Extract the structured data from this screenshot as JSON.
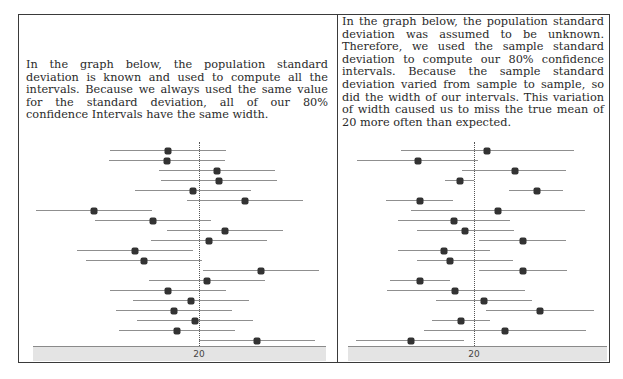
{
  "panels": [
    {
      "id": "left",
      "caption": "In the graph below, the population standard deviation is known and used to compute all the intervals.  Because we always used the same value for the standard deviation, all of our 80% confidence Intervals have the same width.",
      "axis_label": "20"
    },
    {
      "id": "right",
      "caption": "In the graph below, the population standard deviation was assumed to be unknown. Therefore, we used the sample standard deviation to compute our 80% confidence intervals.  Because the sample standard deviation varied from sample to sample, so did the width of our intervals.  This variation of width caused us to miss the true mean of 20 more often than expected.",
      "axis_label": "20"
    }
  ],
  "chart_data": [
    {
      "type": "scatter",
      "title": "80% confidence intervals, population standard deviation known",
      "xlabel": "",
      "ylabel": "",
      "reference_value": 20,
      "tick_labels": [
        "20"
      ],
      "grid": false,
      "legend": null,
      "interval_halfwidth": 5.8,
      "means": [
        16.9,
        16.8,
        21.8,
        22.0,
        19.4,
        24.6,
        9.5,
        15.4,
        22.6,
        21.0,
        13.6,
        14.5,
        26.2,
        20.8,
        16.9,
        19.2,
        17.5,
        19.6,
        17.8,
        25.8
      ],
      "lower": [
        11.1,
        11.0,
        16.0,
        16.2,
        13.6,
        18.8,
        3.7,
        9.6,
        16.8,
        15.2,
        7.8,
        8.7,
        20.4,
        15.0,
        11.1,
        13.4,
        11.7,
        13.8,
        12.0,
        20.0
      ],
      "upper": [
        22.7,
        22.6,
        27.6,
        27.8,
        25.2,
        30.4,
        15.3,
        21.2,
        28.4,
        26.8,
        19.4,
        20.3,
        32.0,
        26.6,
        22.7,
        25.0,
        23.3,
        25.4,
        23.6,
        31.6
      ]
    },
    {
      "type": "scatter",
      "title": "80% confidence intervals, sample standard deviation used",
      "xlabel": "",
      "ylabel": "",
      "reference_value": 20,
      "tick_labels": [
        "20"
      ],
      "grid": false,
      "legend": null,
      "means": [
        21.3,
        14.4,
        24.1,
        18.6,
        26.3,
        14.6,
        22.4,
        18.0,
        19.1,
        24.9,
        17.0,
        17.6,
        24.9,
        14.6,
        18.1,
        21.0,
        26.6,
        18.7,
        23.1,
        13.7
      ],
      "lower": [
        12.7,
        8.3,
        18.8,
        17.1,
        23.5,
        11.2,
        13.7,
        12.4,
        14.3,
        20.5,
        12.4,
        14.3,
        20.5,
        11.6,
        11.3,
        16.2,
        21.2,
        15.8,
        15.0,
        8.2
      ],
      "upper": [
        30.0,
        20.4,
        29.2,
        20.0,
        28.9,
        17.9,
        31.1,
        23.6,
        24.0,
        29.2,
        21.6,
        23.9,
        29.3,
        17.6,
        25.1,
        25.8,
        32.0,
        21.6,
        31.2,
        19.0
      ]
    }
  ]
}
